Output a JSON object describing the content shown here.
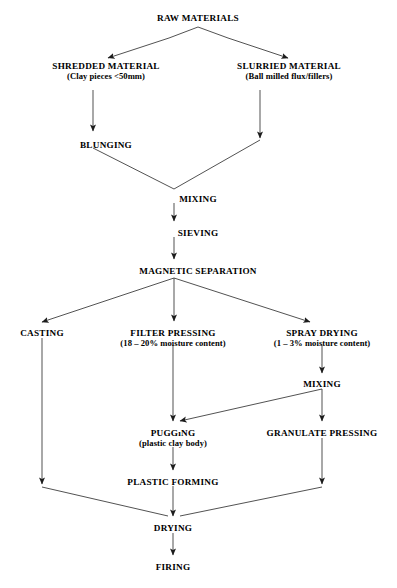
{
  "diagram": {
    "type": "process-flowchart",
    "line_color": "#222222",
    "background_color": "#ffffff",
    "text_color": "#000000",
    "nodes": [
      {
        "id": "raw_materials",
        "title": "RAW MATERIALS",
        "sub": "",
        "x": 198,
        "y": 14
      },
      {
        "id": "shredded_material",
        "title": "SHREDDED MATERIAL",
        "sub": "(Clay pieces <50mm)",
        "x": 106,
        "y": 62
      },
      {
        "id": "slurried_material",
        "title": "SLURRIED MATERIAL",
        "sub": "(Ball milled flux/fillers)",
        "x": 289,
        "y": 62
      },
      {
        "id": "blunging",
        "title": "BLUNGING",
        "sub": "",
        "x": 106,
        "y": 141
      },
      {
        "id": "mixing_1",
        "title": "MIXING",
        "sub": "",
        "x": 198,
        "y": 195
      },
      {
        "id": "sieving",
        "title": "SIEVING",
        "sub": "",
        "x": 198,
        "y": 229
      },
      {
        "id": "magnetic_separation",
        "title": "MAGNETIC SEPARATION",
        "sub": "",
        "x": 198,
        "y": 267
      },
      {
        "id": "casting",
        "title": "CASTING",
        "sub": "",
        "x": 42,
        "y": 329
      },
      {
        "id": "filter_pressing",
        "title": "FILTER PRESSING",
        "sub": "(18 – 20% moisture content)",
        "x": 173,
        "y": 329
      },
      {
        "id": "spray_drying",
        "title": "SPRAY DRYING",
        "sub": "(1 – 3% moisture content)",
        "x": 322,
        "y": 329
      },
      {
        "id": "mixing_2",
        "title": "MIXING",
        "sub": "",
        "x": 322,
        "y": 380
      },
      {
        "id": "pugging",
        "title": "PUGGıNG",
        "sub": "(plastic clay body)",
        "x": 173,
        "y": 429
      },
      {
        "id": "granulate_pressing",
        "title": "GRANULATE PRESSING",
        "sub": "",
        "x": 322,
        "y": 429
      },
      {
        "id": "plastic_forming",
        "title": "PLASTIC FORMING",
        "sub": "",
        "x": 173,
        "y": 478
      },
      {
        "id": "drying",
        "title": "DRYING",
        "sub": "",
        "x": 173,
        "y": 524
      },
      {
        "id": "firing",
        "title": "FIRING",
        "sub": "",
        "x": 173,
        "y": 563
      }
    ],
    "edges": [
      {
        "id": "raw-to-shredded",
        "from": "raw_materials",
        "to": "shredded_material",
        "arrow": true
      },
      {
        "id": "raw-to-slurried",
        "from": "raw_materials",
        "to": "slurried_material",
        "arrow": true
      },
      {
        "id": "shredded-to-blunging",
        "from": "shredded_material",
        "to": "blunging",
        "arrow": true
      },
      {
        "id": "slurried-to-mixing",
        "from": "slurried_material",
        "to": "mixing_1",
        "arrow": true
      },
      {
        "id": "blunging-to-mixing",
        "from": "blunging",
        "to": "mixing_1",
        "arrow": false
      },
      {
        "id": "mixing-to-sieving",
        "from": "mixing_1",
        "to": "sieving",
        "arrow": true
      },
      {
        "id": "sieving-to-magnetic",
        "from": "sieving",
        "to": "magnetic_separation",
        "arrow": true
      },
      {
        "id": "magnetic-to-casting",
        "from": "magnetic_separation",
        "to": "casting",
        "arrow": true
      },
      {
        "id": "magnetic-to-filter",
        "from": "magnetic_separation",
        "to": "filter_pressing",
        "arrow": true
      },
      {
        "id": "magnetic-to-spray",
        "from": "magnetic_separation",
        "to": "spray_drying",
        "arrow": true
      },
      {
        "id": "spray-to-mixing2",
        "from": "spray_drying",
        "to": "mixing_2",
        "arrow": true
      },
      {
        "id": "filter-to-pugging",
        "from": "filter_pressing",
        "to": "pugging",
        "arrow": true
      },
      {
        "id": "mixing2-to-pugging",
        "from": "mixing_2",
        "to": "pugging",
        "arrow": true
      },
      {
        "id": "mixing2-to-granulate",
        "from": "mixing_2",
        "to": "granulate_pressing",
        "arrow": true
      },
      {
        "id": "pugging-to-plasticforming",
        "from": "pugging",
        "to": "plastic_forming",
        "arrow": true
      },
      {
        "id": "plasticforming-to-drying",
        "from": "plastic_forming",
        "to": "drying",
        "arrow": true
      },
      {
        "id": "casting-to-drying",
        "from": "casting",
        "to": "drying",
        "arrow": true
      },
      {
        "id": "granulate-to-drying",
        "from": "granulate_pressing",
        "to": "drying",
        "arrow": true
      },
      {
        "id": "drying-to-firing",
        "from": "drying",
        "to": "firing",
        "arrow": true
      }
    ]
  },
  "footer": {
    "caption": ""
  }
}
